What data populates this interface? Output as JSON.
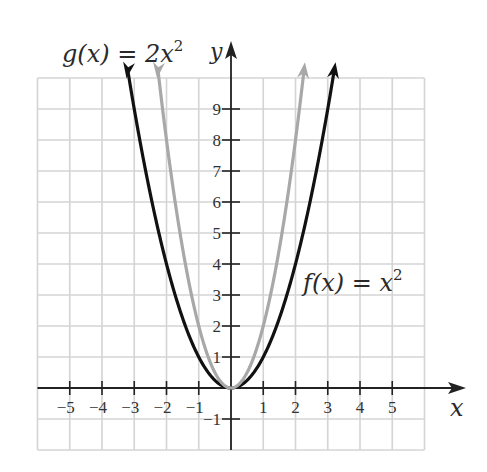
{
  "chart_data": {
    "type": "line",
    "title": "",
    "xlabel": "x",
    "ylabel": "y",
    "xlim": [
      -6,
      6
    ],
    "ylim": [
      -2,
      10
    ],
    "grid": true,
    "x_ticks": [
      "-5",
      "-4",
      "-3",
      "-2",
      "-1",
      "1",
      "2",
      "3",
      "4",
      "5"
    ],
    "y_ticks": [
      "-1",
      "1",
      "2",
      "3",
      "4",
      "5",
      "6",
      "7",
      "8",
      "9"
    ],
    "series": [
      {
        "name": "f(x) = x^2",
        "color": "#111111",
        "formula": "x^2",
        "x": [
          -3,
          -2,
          -1,
          0,
          1,
          2,
          3
        ],
        "values": [
          9,
          4,
          1,
          0,
          1,
          4,
          9
        ]
      },
      {
        "name": "g(x) = 2x^2",
        "color": "#a8a8a8",
        "formula": "2x^2",
        "x": [
          -2,
          -1,
          0,
          1,
          2
        ],
        "values": [
          8,
          2,
          0,
          2,
          8
        ]
      }
    ],
    "annotations": [
      {
        "text": "g(x) = 2x²",
        "position": "top-left"
      },
      {
        "text": "f(x) = x²",
        "position": "right, near y=3"
      }
    ]
  },
  "labels": {
    "g_label": {
      "pre": "g(x) = 2x",
      "sup": "2"
    },
    "f_label": {
      "pre": "f(x) = x",
      "sup": "2"
    },
    "x_axis": "x",
    "y_axis": "y"
  },
  "ticks": {
    "x": [
      {
        "v": -5,
        "t": "−5"
      },
      {
        "v": -4,
        "t": "−4"
      },
      {
        "v": -3,
        "t": "−3"
      },
      {
        "v": -2,
        "t": "−2"
      },
      {
        "v": -1,
        "t": "−1"
      },
      {
        "v": 1,
        "t": "1"
      },
      {
        "v": 2,
        "t": "2"
      },
      {
        "v": 3,
        "t": "3"
      },
      {
        "v": 4,
        "t": "4"
      },
      {
        "v": 5,
        "t": "5"
      }
    ],
    "y": [
      {
        "v": -1,
        "t": "−1"
      },
      {
        "v": 1,
        "t": "1"
      },
      {
        "v": 2,
        "t": "2"
      },
      {
        "v": 3,
        "t": "3"
      },
      {
        "v": 4,
        "t": "4"
      },
      {
        "v": 5,
        "t": "5"
      },
      {
        "v": 6,
        "t": "6"
      },
      {
        "v": 7,
        "t": "7"
      },
      {
        "v": 8,
        "t": "8"
      },
      {
        "v": 9,
        "t": "9"
      }
    ]
  },
  "colors": {
    "grid": "#d4d4d4",
    "axis": "#222222",
    "f": "#111111",
    "g": "#a8a8a8"
  }
}
